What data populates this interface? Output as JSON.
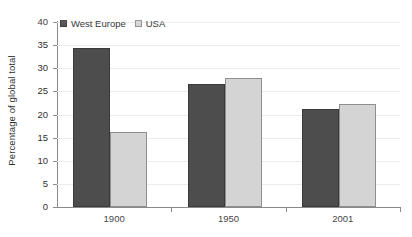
{
  "chart_data": {
    "type": "bar",
    "title": "",
    "subtitle": "",
    "xlabel": "",
    "ylabel": "Percentage of global total",
    "categories": [
      "1900",
      "1950",
      "2001"
    ],
    "series": [
      {
        "name": "West Europe",
        "color": "#4d4d4d",
        "values": [
          34.3,
          26.7,
          21.3
        ]
      },
      {
        "name": "USA",
        "color": "#d4d4d4",
        "values": [
          16.3,
          28.0,
          22.3
        ]
      }
    ],
    "ylim": [
      0,
      40
    ],
    "ytick_step": 5,
    "yticks": [
      "40",
      "35",
      "30",
      "25",
      "20",
      "15",
      "10",
      "5",
      "0"
    ],
    "grid": "horizontal",
    "legend_position": "top-left",
    "annotations": []
  },
  "legend": {
    "items": [
      {
        "label": "West Europe",
        "swatch": "dark-square-swatch"
      },
      {
        "label": "USA",
        "swatch": "light-square-swatch"
      }
    ]
  },
  "axis": {
    "y_title": "Percentage of global total"
  }
}
